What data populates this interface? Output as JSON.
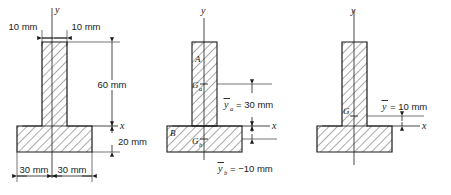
{
  "figures": [
    {
      "id": "figure-1",
      "name": "dimensioned-t-section",
      "axis_y": "y",
      "axis_x": "x",
      "dimensions": {
        "web_left": "10 mm",
        "web_right": "10 mm",
        "web_height": "60 mm",
        "flange_height": "20 mm",
        "flange_left": "30 mm",
        "flange_right": "30 mm"
      }
    },
    {
      "id": "figure-2",
      "name": "decomposed-t-section",
      "axis_y": "y",
      "axis_x": "x",
      "parts": {
        "web_label": "A",
        "web_centroid": "G",
        "web_centroid_sub": "a",
        "flange_label": "B",
        "flange_centroid": "G",
        "flange_centroid_sub": "b"
      },
      "annotations": {
        "ybar_a_symbol": "y",
        "ybar_a_sub": "a",
        "ybar_a_value": "= 30 mm",
        "ybar_b_symbol": "y",
        "ybar_b_sub": "b",
        "ybar_b_value": "= −10 mm"
      }
    },
    {
      "id": "figure-3",
      "name": "composite-centroid-t-section",
      "axis_y": "y",
      "axis_x": "x",
      "centroid_label": "G",
      "annotations": {
        "ybar_symbol": "y",
        "ybar_value": "= 10 mm"
      }
    }
  ],
  "colors": {
    "outline": "#1a1a1a",
    "hatch": "#2b2b2b",
    "fill": "#ffffff",
    "dimension": "#1a1a1a"
  }
}
